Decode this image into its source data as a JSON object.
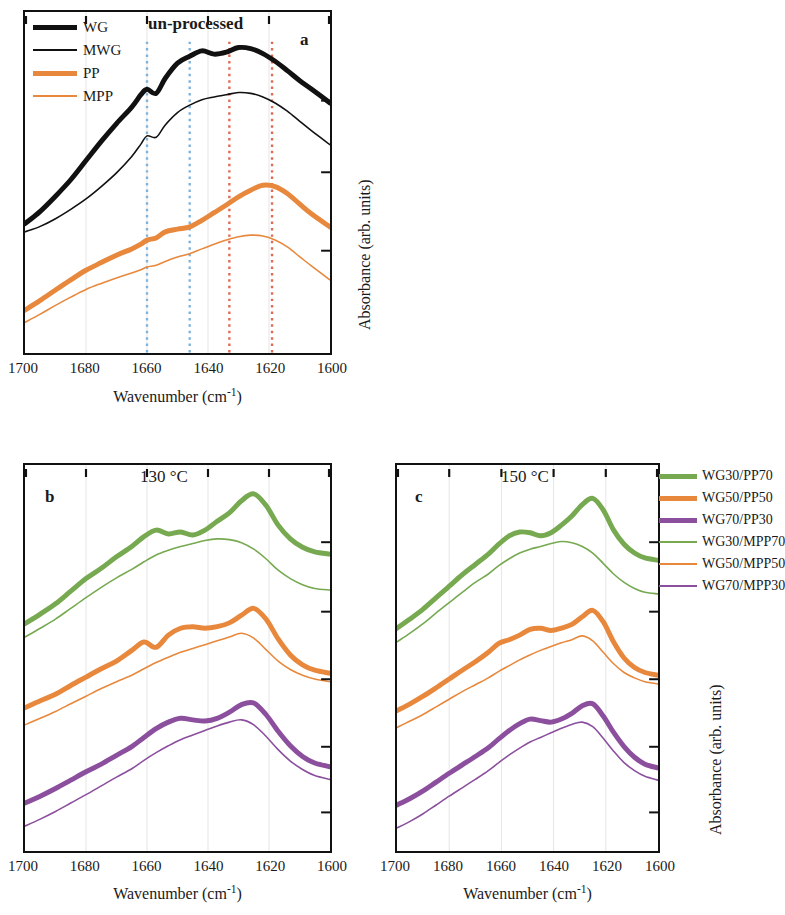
{
  "figure": {
    "panels": [
      {
        "id": "a",
        "letter": "a",
        "title": "un-processed",
        "xlabel_main": "Wavenumber (cm",
        "xlabel_sup": "-1",
        "xlabel_tail": ")",
        "ylabel": "Absorbance (arb. units)"
      },
      {
        "id": "b",
        "letter": "b",
        "title": "130 °C",
        "xlabel_main": "Wavenumber (cm",
        "xlabel_sup": "-1",
        "xlabel_tail": ")",
        "ylabel": ""
      },
      {
        "id": "c",
        "letter": "c",
        "title": "150 °C",
        "xlabel_main": "Wavenumber (cm",
        "xlabel_sup": "-1",
        "xlabel_tail": ")",
        "ylabel": "Absorbance (arb. units)"
      }
    ],
    "legend_a": [
      {
        "label": "WG",
        "color": "#111111",
        "width": 5.0
      },
      {
        "label": "MWG",
        "color": "#111111",
        "width": 1.6
      },
      {
        "label": "PP",
        "color": "#E8883C",
        "width": 5.0
      },
      {
        "label": "MPP",
        "color": "#E8883C",
        "width": 1.6
      }
    ],
    "legend_c": [
      {
        "label": "WG30/PP70",
        "color": "#76A950",
        "width": 5.0
      },
      {
        "label": "WG50/PP50",
        "color": "#E8883C",
        "width": 5.0
      },
      {
        "label": "WG70/PP30",
        "color": "#8B4F9E",
        "width": 5.0
      },
      {
        "label": "WG30/MPP70",
        "color": "#76A950",
        "width": 1.6
      },
      {
        "label": "WG50/MPP50",
        "color": "#E8883C",
        "width": 1.6
      },
      {
        "label": "WG70/MPP30",
        "color": "#8B4F9E",
        "width": 1.6
      }
    ]
  },
  "chart_data": {
    "type": "line",
    "xlabel": "Wavenumber (cm-1)",
    "ylabel": "Absorbance (arb. units)",
    "xlim": [
      1700,
      1600
    ],
    "xticks": [
      1700,
      1680,
      1660,
      1640,
      1620,
      1600
    ],
    "xtick_labels": [
      "1700",
      "1680",
      "1660",
      "1640",
      "1620",
      "1600"
    ],
    "ylim": [
      0,
      1
    ],
    "grid": "vertical-faint",
    "legend_position": "panel-a-inside-topleft; panel-c-right-outside",
    "panels": [
      {
        "id": "a",
        "title": "un-processed",
        "marker_lines": [
          {
            "x": 1660,
            "color": "#7FB3DC",
            "style": "dotted"
          },
          {
            "x": 1646,
            "color": "#7FB3DC",
            "style": "dotted"
          },
          {
            "x": 1633,
            "color": "#E06A52",
            "style": "dotted"
          },
          {
            "x": 1619,
            "color": "#E06A52",
            "style": "dotted"
          }
        ],
        "x": [
          1700,
          1695,
          1690,
          1685,
          1680,
          1675,
          1670,
          1665,
          1662,
          1660,
          1657,
          1654,
          1650,
          1646,
          1642,
          1638,
          1634,
          1630,
          1626,
          1622,
          1618,
          1614,
          1610,
          1606,
          1600
        ],
        "series": [
          {
            "name": "WG",
            "color": "#111111",
            "width": 5.0,
            "values": [
              0.03,
              0.075,
              0.13,
              0.19,
              0.26,
              0.33,
              0.395,
              0.455,
              0.5,
              0.52,
              0.505,
              0.56,
              0.615,
              0.64,
              0.66,
              0.648,
              0.655,
              0.672,
              0.668,
              0.65,
              0.622,
              0.588,
              0.552,
              0.52,
              0.47
            ]
          },
          {
            "name": "MWG",
            "color": "#111111",
            "width": 1.6,
            "values": [
              0.0,
              0.02,
              0.048,
              0.082,
              0.12,
              0.165,
              0.215,
              0.275,
              0.32,
              0.35,
              0.345,
              0.39,
              0.435,
              0.462,
              0.482,
              0.492,
              0.5,
              0.508,
              0.505,
              0.492,
              0.47,
              0.44,
              0.404,
              0.368,
              0.318
            ]
          },
          {
            "name": "PP",
            "color": "#E8883C",
            "width": 5.0,
            "values": [
              -0.285,
              -0.25,
              -0.212,
              -0.175,
              -0.14,
              -0.112,
              -0.085,
              -0.062,
              -0.045,
              -0.03,
              -0.022,
              0.0,
              0.01,
              0.018,
              0.042,
              0.07,
              0.098,
              0.128,
              0.152,
              0.17,
              0.165,
              0.14,
              0.102,
              0.065,
              0.018
            ]
          },
          {
            "name": "MPP",
            "color": "#E8883C",
            "width": 1.6,
            "values": [
              -0.33,
              -0.3,
              -0.268,
              -0.238,
              -0.21,
              -0.188,
              -0.168,
              -0.15,
              -0.138,
              -0.128,
              -0.122,
              -0.108,
              -0.092,
              -0.08,
              -0.062,
              -0.045,
              -0.03,
              -0.018,
              -0.012,
              -0.015,
              -0.03,
              -0.055,
              -0.09,
              -0.125,
              -0.175
            ]
          }
        ]
      },
      {
        "id": "b",
        "title": "130 °C",
        "x": [
          1700,
          1695,
          1690,
          1685,
          1680,
          1675,
          1670,
          1665,
          1661,
          1657,
          1653,
          1649,
          1645,
          1641,
          1637,
          1633,
          1629,
          1625,
          1621,
          1617,
          1613,
          1609,
          1605,
          1600
        ],
        "series": [
          {
            "name": "WG30/PP70",
            "color": "#76A950",
            "width": 5.0,
            "values": [
              0.56,
              0.585,
              0.612,
              0.645,
              0.678,
              0.705,
              0.735,
              0.762,
              0.788,
              0.805,
              0.795,
              0.8,
              0.792,
              0.805,
              0.828,
              0.85,
              0.882,
              0.9,
              0.87,
              0.818,
              0.782,
              0.76,
              0.748,
              0.742
            ]
          },
          {
            "name": "WG30/MPP70",
            "color": "#76A950",
            "width": 1.6,
            "values": [
              0.525,
              0.548,
              0.572,
              0.6,
              0.628,
              0.655,
              0.68,
              0.702,
              0.722,
              0.74,
              0.752,
              0.762,
              0.77,
              0.778,
              0.782,
              0.78,
              0.772,
              0.755,
              0.73,
              0.7,
              0.678,
              0.662,
              0.652,
              0.648
            ]
          },
          {
            "name": "WG50/PP50",
            "color": "#E8883C",
            "width": 5.0,
            "values": [
              0.34,
              0.358,
              0.375,
              0.398,
              0.42,
              0.442,
              0.462,
              0.49,
              0.512,
              0.498,
              0.53,
              0.548,
              0.552,
              0.548,
              0.552,
              0.562,
              0.582,
              0.6,
              0.572,
              0.52,
              0.478,
              0.452,
              0.438,
              0.43
            ]
          },
          {
            "name": "WG50/MPP50",
            "color": "#E8883C",
            "width": 1.6,
            "values": [
              0.295,
              0.312,
              0.33,
              0.35,
              0.37,
              0.39,
              0.408,
              0.425,
              0.442,
              0.458,
              0.472,
              0.485,
              0.495,
              0.505,
              0.515,
              0.525,
              0.535,
              0.522,
              0.492,
              0.462,
              0.44,
              0.425,
              0.415,
              0.408
            ]
          },
          {
            "name": "WG70/PP30",
            "color": "#8B4F9E",
            "width": 5.0,
            "values": [
              0.09,
              0.108,
              0.128,
              0.15,
              0.172,
              0.192,
              0.215,
              0.238,
              0.262,
              0.285,
              0.302,
              0.312,
              0.308,
              0.305,
              0.312,
              0.328,
              0.348,
              0.352,
              0.322,
              0.278,
              0.24,
              0.212,
              0.195,
              0.185
            ]
          },
          {
            "name": "WG70/MPP30",
            "color": "#8B4F9E",
            "width": 1.6,
            "values": [
              0.03,
              0.048,
              0.068,
              0.09,
              0.112,
              0.135,
              0.158,
              0.18,
              0.202,
              0.222,
              0.24,
              0.256,
              0.268,
              0.28,
              0.292,
              0.302,
              0.308,
              0.295,
              0.265,
              0.23,
              0.2,
              0.178,
              0.162,
              0.152
            ]
          }
        ]
      },
      {
        "id": "c",
        "title": "150 °C",
        "x": [
          1700,
          1695,
          1690,
          1685,
          1680,
          1675,
          1670,
          1665,
          1661,
          1657,
          1653,
          1649,
          1645,
          1641,
          1637,
          1633,
          1629,
          1625,
          1621,
          1617,
          1613,
          1609,
          1605,
          1600
        ],
        "series": [
          {
            "name": "WG30/PP70",
            "color": "#76A950",
            "width": 5.0,
            "values": [
              0.548,
              0.572,
              0.598,
              0.628,
              0.658,
              0.688,
              0.715,
              0.742,
              0.768,
              0.79,
              0.8,
              0.798,
              0.79,
              0.798,
              0.818,
              0.842,
              0.872,
              0.888,
              0.858,
              0.805,
              0.768,
              0.745,
              0.732,
              0.726
            ]
          },
          {
            "name": "WG30/MPP70",
            "color": "#76A950",
            "width": 1.6,
            "values": [
              0.512,
              0.535,
              0.56,
              0.588,
              0.615,
              0.642,
              0.668,
              0.69,
              0.712,
              0.73,
              0.745,
              0.755,
              0.762,
              0.77,
              0.775,
              0.772,
              0.762,
              0.745,
              0.718,
              0.69,
              0.668,
              0.652,
              0.642,
              0.638
            ]
          },
          {
            "name": "WG50/PP50",
            "color": "#E8883C",
            "width": 5.0,
            "values": [
              0.332,
              0.35,
              0.37,
              0.392,
              0.415,
              0.438,
              0.46,
              0.485,
              0.508,
              0.518,
              0.53,
              0.545,
              0.548,
              0.542,
              0.548,
              0.558,
              0.578,
              0.595,
              0.565,
              0.512,
              0.47,
              0.445,
              0.432,
              0.425
            ]
          },
          {
            "name": "WG50/MPP50",
            "color": "#E8883C",
            "width": 1.6,
            "values": [
              0.288,
              0.305,
              0.322,
              0.342,
              0.362,
              0.382,
              0.4,
              0.418,
              0.435,
              0.45,
              0.465,
              0.478,
              0.49,
              0.5,
              0.51,
              0.518,
              0.528,
              0.515,
              0.485,
              0.455,
              0.432,
              0.418,
              0.408,
              0.402
            ]
          },
          {
            "name": "WG70/PP30",
            "color": "#8B4F9E",
            "width": 5.0,
            "values": [
              0.085,
              0.102,
              0.122,
              0.145,
              0.168,
              0.19,
              0.212,
              0.235,
              0.258,
              0.28,
              0.298,
              0.31,
              0.306,
              0.302,
              0.31,
              0.325,
              0.345,
              0.35,
              0.318,
              0.275,
              0.238,
              0.21,
              0.192,
              0.182
            ]
          },
          {
            "name": "WG70/MPP30",
            "color": "#8B4F9E",
            "width": 1.6,
            "values": [
              0.025,
              0.042,
              0.062,
              0.085,
              0.108,
              0.13,
              0.152,
              0.175,
              0.196,
              0.216,
              0.234,
              0.25,
              0.262,
              0.274,
              0.286,
              0.296,
              0.302,
              0.29,
              0.26,
              0.226,
              0.196,
              0.175,
              0.16,
              0.15
            ]
          }
        ]
      }
    ]
  }
}
